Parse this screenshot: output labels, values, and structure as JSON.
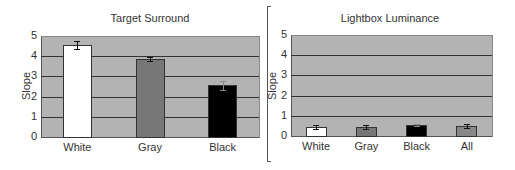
{
  "chart_data": [
    {
      "type": "bar",
      "title": "Target Surround",
      "xlabel": "",
      "ylabel": "Slope",
      "ylim": [
        0,
        5
      ],
      "yticks": [
        "0",
        "1",
        "2",
        "3",
        "4",
        "5"
      ],
      "grid": true,
      "categories": [
        "White",
        "Gray",
        "Black"
      ],
      "values": [
        4.6,
        3.9,
        2.6
      ],
      "errors": [
        0.2,
        0.1,
        0.2
      ],
      "colors": [
        "#ffffff",
        "#777777",
        "#000000"
      ]
    },
    {
      "type": "bar",
      "title": "Lightbox Luminance",
      "xlabel": "",
      "ylabel": "Slope",
      "ylim": [
        0,
        5
      ],
      "yticks": [
        "0",
        "1",
        "2",
        "3",
        "4",
        "5"
      ],
      "grid": true,
      "categories": [
        "White",
        "Gray",
        "Black",
        "All"
      ],
      "values": [
        0.5,
        0.5,
        0.6,
        0.55
      ],
      "errors": [
        0.1,
        0.1,
        0.05,
        0.1
      ],
      "colors": [
        "#ffffff",
        "#777777",
        "#000000",
        "#888888"
      ]
    }
  ],
  "plot_background": "#b3b3b3"
}
